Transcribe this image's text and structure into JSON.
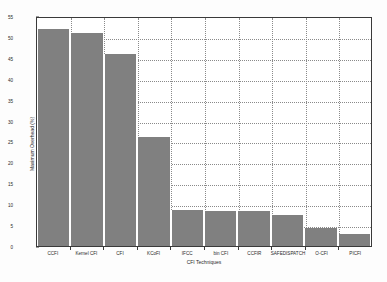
{
  "chart_data": {
    "type": "bar",
    "title": "",
    "xlabel": "CFI Techniques",
    "ylabel": "Maximum Overhead (%)",
    "categories": [
      "CCFI",
      "Kernel CFI",
      "CFI",
      "KCoFI",
      "IFCC",
      "bin CFI",
      "CCFIR",
      "SAFEDISPATCH",
      "O-CFI",
      "PICFI"
    ],
    "values": [
      52.0,
      51.0,
      46.0,
      26.0,
      8.6,
      8.4,
      8.4,
      7.3,
      4.4,
      2.9
    ],
    "ylim": [
      0,
      55
    ],
    "ytick_values": [
      0,
      5,
      10,
      15,
      20,
      25,
      30,
      35,
      40,
      45,
      50,
      55
    ],
    "ytick_labels": [
      "0",
      "5",
      "10",
      "15",
      "20",
      "25",
      "30",
      "35",
      "40",
      "45",
      "50",
      "55"
    ],
    "grid": true,
    "legend": "none",
    "bar_color": "#808080",
    "bar_edge_color": "#ffffff",
    "axes_color": "#3a3a3a",
    "grid_color": "#8a8a8a",
    "background_color": "#ffffff"
  }
}
